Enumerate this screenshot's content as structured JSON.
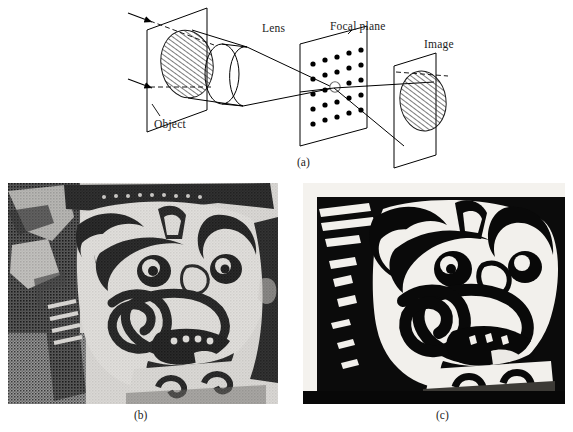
{
  "figure": {
    "panels": [
      {
        "id": "a",
        "caption": "(a)",
        "type": "optical-ray-diagram",
        "description": "Schematic of a lens imaging system showing an object plane, a lens, a focal plane containing a grid of sampling points, and an image plane.",
        "labels": {
          "object": "Object",
          "lens": "Lens",
          "focal_plane": "Focal plane",
          "image": "Image"
        },
        "focal_plane_grid": {
          "rows": 5,
          "cols": 5,
          "dot_count": 25,
          "marked_point_index": 12,
          "marked_point_style": "open-circle"
        },
        "incoming_rays": 2
      },
      {
        "id": "b",
        "caption": "(b)",
        "type": "photograph",
        "description": "Halftone photograph of an ornamental carved demon mask (yaksha) with bulging eyes, fanged mouth and spiral scroll motifs; normal contrast."
      },
      {
        "id": "c",
        "caption": "(c)",
        "type": "photograph",
        "description": "The same ornamental carved demon mask after high-contrast / thresholding filtering; strong black and white separation."
      }
    ]
  },
  "colors": {
    "background": "#ffffff",
    "ink": "#1c1c1c",
    "line": "#000000",
    "hatch": "#2b2b2b"
  }
}
